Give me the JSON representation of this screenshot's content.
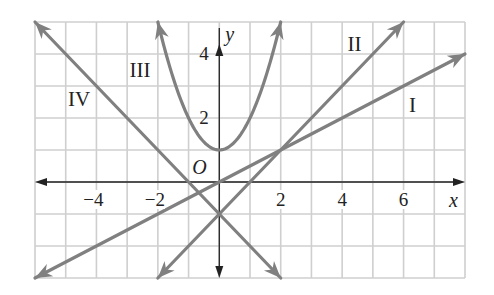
{
  "chart_data": {
    "type": "line",
    "title": "",
    "xlabel": "x",
    "ylabel": "y",
    "origin_label": "O",
    "xlim": [
      -6,
      8
    ],
    "ylim": [
      -3,
      5
    ],
    "grid": true,
    "x_ticks": [
      -4,
      -2,
      2,
      4,
      6
    ],
    "x_tick_labels": [
      "−4",
      "−2",
      "2",
      "4",
      "6"
    ],
    "y_ticks": [
      2,
      4
    ],
    "y_tick_labels": [
      "2",
      "4"
    ],
    "series": [
      {
        "name": "I",
        "equation": "y = x/2",
        "x": [
          -6,
          8
        ],
        "y": [
          -3,
          4
        ]
      },
      {
        "name": "II",
        "equation": "y = x - 1",
        "x": [
          -2,
          6
        ],
        "y": [
          -3,
          5
        ]
      },
      {
        "name": "III",
        "equation": "y = x^2 + 1",
        "x": [
          -2,
          -1,
          0,
          1,
          2
        ],
        "y": [
          5,
          2,
          1,
          2,
          5
        ]
      },
      {
        "name": "IV",
        "equation": "y = -x - 1",
        "x": [
          -6,
          2
        ],
        "y": [
          5,
          -3
        ]
      }
    ],
    "curve_labels": [
      {
        "text": "I",
        "x": 6.5,
        "y": 2.4
      },
      {
        "text": "II",
        "x": 4.5,
        "y": 4.3
      },
      {
        "text": "III",
        "x": -2.6,
        "y": 3.5
      },
      {
        "text": "IV",
        "x": -4.6,
        "y": 2.6
      }
    ],
    "colors": {
      "curve": "#808080",
      "grid": "#cfcfcf",
      "axis": "#222222"
    }
  }
}
